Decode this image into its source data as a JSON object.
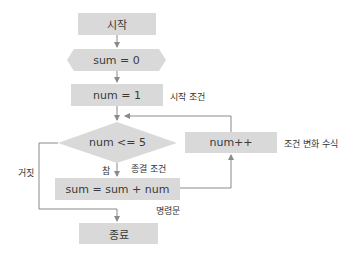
{
  "flowchart": {
    "nodes": {
      "start": {
        "label": "시작",
        "shape": "terminal"
      },
      "init_sum": {
        "label": "sum = 0",
        "shape": "preparation"
      },
      "init_num": {
        "label": "num = 1",
        "shape": "process"
      },
      "condition": {
        "label": "num <= 5",
        "shape": "decision"
      },
      "body": {
        "label": "sum = sum + num",
        "shape": "process"
      },
      "increment": {
        "label": "num++",
        "shape": "process"
      },
      "end": {
        "label": "종료",
        "shape": "terminal"
      }
    },
    "annotations": {
      "start_condition": "시작 조건",
      "end_condition": "종결 조건",
      "update_expression": "조건 변화 수식",
      "statement": "명령문",
      "true_branch": "참",
      "false_branch": "거짓"
    },
    "colors": {
      "node_fill": "#d9d9d9",
      "line": "#8a8a8a",
      "text": "#333333"
    }
  }
}
